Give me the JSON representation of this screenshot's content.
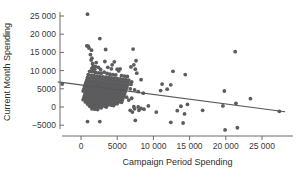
{
  "chart_data": {
    "type": "scatter",
    "title": "",
    "xlabel": "Campaign Period Spending",
    "ylabel": "Current Month Spending",
    "xlim": [
      -3500,
      29000
    ],
    "ylim": [
      -7500,
      27000
    ],
    "grid": false,
    "legend": null,
    "x_ticks": [
      0,
      5000,
      10000,
      15000,
      20000,
      25000
    ],
    "x_tick_labels": [
      "0",
      "5000",
      "10 000",
      "15 000",
      "20 000",
      "25 000"
    ],
    "y_ticks": [
      -5000,
      0,
      5000,
      10000,
      15000,
      20000,
      25000
    ],
    "y_tick_labels": [
      "−5000",
      "0",
      "5000",
      "10 000",
      "15 000",
      "20 000",
      "25 000"
    ],
    "marker": {
      "shape": "circle",
      "color": "#5c5c5e",
      "radius": 1.9
    },
    "fit_line": {
      "type": "linear-regression",
      "color": "#58585a",
      "x_start": -3200,
      "y_start": 6900,
      "x_end": 28200,
      "y_end": -1300
    },
    "points": [
      [
        -2600,
        6300
      ],
      [
        900,
        25500
      ],
      [
        2600,
        18800
      ],
      [
        800,
        16800
      ],
      [
        1000,
        16700
      ],
      [
        1100,
        16200
      ],
      [
        1450,
        15600
      ],
      [
        1300,
        14400
      ],
      [
        1500,
        13400
      ],
      [
        1400,
        12900
      ],
      [
        3400,
        15800
      ],
      [
        7200,
        15900
      ],
      [
        21300,
        15200
      ],
      [
        3300,
        12500
      ],
      [
        4600,
        12400
      ],
      [
        2100,
        12200
      ],
      [
        1600,
        11900
      ],
      [
        1700,
        11200
      ],
      [
        2000,
        11100
      ],
      [
        2400,
        10900
      ],
      [
        1500,
        10600
      ],
      [
        1900,
        10400
      ],
      [
        2700,
        10300
      ],
      [
        3700,
        10900
      ],
      [
        4200,
        10500
      ],
      [
        5000,
        10400
      ],
      [
        5400,
        10500
      ],
      [
        5200,
        9900
      ],
      [
        7500,
        10400
      ],
      [
        7700,
        9300
      ],
      [
        12700,
        9800
      ],
      [
        14400,
        8900
      ],
      [
        1200,
        9800
      ],
      [
        1600,
        9700
      ],
      [
        2000,
        9500
      ],
      [
        2400,
        9400
      ],
      [
        2800,
        9300
      ],
      [
        3200,
        9600
      ],
      [
        3600,
        9200
      ],
      [
        4000,
        9000
      ],
      [
        4400,
        8900
      ],
      [
        4800,
        8800
      ],
      [
        5600,
        8600
      ],
      [
        6000,
        8500
      ],
      [
        6400,
        8400
      ],
      [
        1000,
        8900
      ],
      [
        1400,
        8700
      ],
      [
        1800,
        8600
      ],
      [
        2200,
        8500
      ],
      [
        2600,
        8400
      ],
      [
        3000,
        8300
      ],
      [
        3400,
        8200
      ],
      [
        3800,
        8100
      ],
      [
        4200,
        8000
      ],
      [
        4600,
        7900
      ],
      [
        5000,
        7800
      ],
      [
        5400,
        7700
      ],
      [
        5800,
        7600
      ],
      [
        6200,
        7500
      ],
      [
        6600,
        7400
      ],
      [
        8300,
        7500
      ],
      [
        900,
        8100
      ],
      [
        1300,
        8000
      ],
      [
        1700,
        7900
      ],
      [
        2100,
        7800
      ],
      [
        2500,
        7700
      ],
      [
        2900,
        7600
      ],
      [
        3300,
        7500
      ],
      [
        3700,
        7400
      ],
      [
        4100,
        7300
      ],
      [
        4500,
        7200
      ],
      [
        4900,
        7100
      ],
      [
        5300,
        7000
      ],
      [
        5700,
        6900
      ],
      [
        6100,
        6800
      ],
      [
        6500,
        6700
      ],
      [
        7000,
        6900
      ],
      [
        800,
        7400
      ],
      [
        1200,
        7300
      ],
      [
        1600,
        7200
      ],
      [
        2000,
        7100
      ],
      [
        2400,
        7000
      ],
      [
        2800,
        6900
      ],
      [
        3200,
        6800
      ],
      [
        3600,
        6700
      ],
      [
        4000,
        6600
      ],
      [
        4400,
        6500
      ],
      [
        4800,
        6400
      ],
      [
        5200,
        6300
      ],
      [
        5600,
        6200
      ],
      [
        6000,
        6100
      ],
      [
        6400,
        6000
      ],
      [
        6900,
        6200
      ],
      [
        700,
        6800
      ],
      [
        1100,
        6700
      ],
      [
        1500,
        6600
      ],
      [
        1900,
        6500
      ],
      [
        2300,
        6400
      ],
      [
        2700,
        6300
      ],
      [
        3100,
        6200
      ],
      [
        3500,
        6100
      ],
      [
        3900,
        6000
      ],
      [
        4300,
        5900
      ],
      [
        4700,
        5800
      ],
      [
        5100,
        5700
      ],
      [
        5500,
        5600
      ],
      [
        5900,
        5500
      ],
      [
        6300,
        5400
      ],
      [
        600,
        6200
      ],
      [
        1000,
        6100
      ],
      [
        1400,
        6000
      ],
      [
        1800,
        5900
      ],
      [
        2200,
        5800
      ],
      [
        2600,
        5700
      ],
      [
        3000,
        5600
      ],
      [
        3400,
        5500
      ],
      [
        3800,
        5400
      ],
      [
        4200,
        5300
      ],
      [
        4600,
        5200
      ],
      [
        5000,
        5100
      ],
      [
        5400,
        5000
      ],
      [
        5800,
        4900
      ],
      [
        6200,
        4800
      ],
      [
        6800,
        5000
      ],
      [
        500,
        5600
      ],
      [
        900,
        5500
      ],
      [
        1300,
        5400
      ],
      [
        1700,
        5300
      ],
      [
        2100,
        5200
      ],
      [
        2500,
        5100
      ],
      [
        2900,
        5000
      ],
      [
        3300,
        4900
      ],
      [
        3700,
        4800
      ],
      [
        4100,
        4700
      ],
      [
        4500,
        4600
      ],
      [
        4900,
        4500
      ],
      [
        5300,
        4400
      ],
      [
        5700,
        4300
      ],
      [
        6100,
        4200
      ],
      [
        7400,
        4700
      ],
      [
        400,
        5000
      ],
      [
        800,
        4900
      ],
      [
        1200,
        4800
      ],
      [
        1600,
        4700
      ],
      [
        2000,
        4600
      ],
      [
        2400,
        4500
      ],
      [
        2800,
        4400
      ],
      [
        3200,
        4300
      ],
      [
        3600,
        4200
      ],
      [
        4000,
        4100
      ],
      [
        4400,
        4000
      ],
      [
        4800,
        3900
      ],
      [
        5200,
        3800
      ],
      [
        5600,
        3700
      ],
      [
        6000,
        3600
      ],
      [
        7900,
        4200
      ],
      [
        300,
        4400
      ],
      [
        700,
        4300
      ],
      [
        1100,
        4200
      ],
      [
        1500,
        4100
      ],
      [
        1900,
        4000
      ],
      [
        2300,
        3900
      ],
      [
        2700,
        3800
      ],
      [
        3100,
        3700
      ],
      [
        3500,
        3600
      ],
      [
        3900,
        3500
      ],
      [
        4300,
        3400
      ],
      [
        4700,
        3300
      ],
      [
        5100,
        3200
      ],
      [
        5500,
        3100
      ],
      [
        5900,
        3000
      ],
      [
        8600,
        3800
      ],
      [
        600,
        3800
      ],
      [
        1000,
        3700
      ],
      [
        1400,
        3600
      ],
      [
        1800,
        3500
      ],
      [
        2200,
        3400
      ],
      [
        2600,
        3300
      ],
      [
        3000,
        3200
      ],
      [
        3400,
        3100
      ],
      [
        3800,
        3000
      ],
      [
        4200,
        2900
      ],
      [
        4600,
        2800
      ],
      [
        5000,
        2700
      ],
      [
        5400,
        2600
      ],
      [
        5800,
        2500
      ],
      [
        6300,
        2700
      ],
      [
        500,
        3200
      ],
      [
        900,
        3100
      ],
      [
        1300,
        3000
      ],
      [
        1700,
        2900
      ],
      [
        2100,
        2800
      ],
      [
        2500,
        2700
      ],
      [
        2900,
        2600
      ],
      [
        3300,
        2500
      ],
      [
        3700,
        2400
      ],
      [
        4100,
        2300
      ],
      [
        4500,
        2200
      ],
      [
        4900,
        2100
      ],
      [
        5300,
        2000
      ],
      [
        5700,
        1900
      ],
      [
        7000,
        2400
      ],
      [
        400,
        2600
      ],
      [
        800,
        2500
      ],
      [
        1200,
        2400
      ],
      [
        1600,
        2300
      ],
      [
        2000,
        2200
      ],
      [
        2400,
        2100
      ],
      [
        2800,
        2000
      ],
      [
        3200,
        1900
      ],
      [
        3600,
        1800
      ],
      [
        4000,
        1700
      ],
      [
        4400,
        1600
      ],
      [
        4800,
        1500
      ],
      [
        5200,
        1400
      ],
      [
        6600,
        1900
      ],
      [
        300,
        2000
      ],
      [
        700,
        1900
      ],
      [
        1100,
        1800
      ],
      [
        1500,
        1700
      ],
      [
        1900,
        1600
      ],
      [
        2300,
        1500
      ],
      [
        2700,
        1400
      ],
      [
        3100,
        1300
      ],
      [
        3500,
        1200
      ],
      [
        3900,
        1100
      ],
      [
        4300,
        1000
      ],
      [
        4700,
        900
      ],
      [
        5600,
        1300
      ],
      [
        600,
        1400
      ],
      [
        1000,
        1300
      ],
      [
        1400,
        1200
      ],
      [
        1800,
        1100
      ],
      [
        2200,
        1000
      ],
      [
        2600,
        900
      ],
      [
        3000,
        800
      ],
      [
        3400,
        700
      ],
      [
        3800,
        600
      ],
      [
        4200,
        500
      ],
      [
        5000,
        900
      ],
      [
        900,
        800
      ],
      [
        1300,
        700
      ],
      [
        1700,
        600
      ],
      [
        2100,
        500
      ],
      [
        2500,
        400
      ],
      [
        2900,
        300
      ],
      [
        3300,
        200
      ],
      [
        4500,
        400
      ],
      [
        1200,
        200
      ],
      [
        1600,
        100
      ],
      [
        2000,
        0
      ],
      [
        2400,
        -100
      ],
      [
        2800,
        -200
      ],
      [
        3500,
        0
      ],
      [
        1500,
        -500
      ],
      [
        1900,
        -600
      ],
      [
        2300,
        -700
      ],
      [
        7300,
        100
      ],
      [
        7900,
        0
      ],
      [
        8300,
        -400
      ],
      [
        8000,
        -900
      ],
      [
        8700,
        -600
      ],
      [
        9300,
        300
      ],
      [
        10400,
        -1400
      ],
      [
        11200,
        6300
      ],
      [
        11000,
        4500
      ],
      [
        11900,
        4900
      ],
      [
        12400,
        6100
      ],
      [
        13300,
        -1000
      ],
      [
        13800,
        200
      ],
      [
        14300,
        -1900
      ],
      [
        14700,
        700
      ],
      [
        16800,
        -900
      ],
      [
        19600,
        300
      ],
      [
        19800,
        4400
      ],
      [
        19900,
        -6300
      ],
      [
        21400,
        1000
      ],
      [
        21600,
        -5700
      ],
      [
        23400,
        2300
      ],
      [
        27400,
        -1200
      ],
      [
        900,
        -4000
      ],
      [
        2600,
        -4000
      ],
      [
        7500,
        -3700
      ],
      [
        7100,
        -1400
      ],
      [
        7400,
        -500
      ],
      [
        6800,
        -900
      ],
      [
        12400,
        -4200
      ],
      [
        14100,
        -4400
      ],
      [
        6900,
        11000
      ],
      [
        4300,
        11600
      ],
      [
        7300,
        11600
      ],
      [
        7600,
        12700
      ]
    ]
  }
}
